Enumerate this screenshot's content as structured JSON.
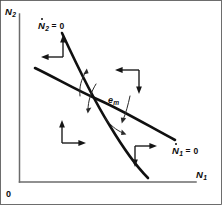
{
  "figure": {
    "kind": "phase-plane-nullcline-diagram",
    "width": 222,
    "height": 205,
    "background_color": "#ffffff",
    "border_color": "#4a4a4a",
    "curve_color": "#101010",
    "axis_color": "#6b6b6b",
    "arrow_color": "#151515"
  },
  "axes": {
    "y_label_var": "N",
    "y_label_sub": "2",
    "x_label_var": "N",
    "x_label_sub": "1",
    "origin_label": "0"
  },
  "nullclines": [
    {
      "id": "n2-nullcline",
      "label_var": "N",
      "label_sub": "2",
      "label_eq": "= 0",
      "overdot": true,
      "shape": "steep-descending",
      "start": [
        62,
        33
      ],
      "end": [
        148,
        178
      ]
    },
    {
      "id": "n1-nullcline",
      "label_var": "N",
      "label_sub": "1",
      "label_eq": "= 0",
      "overdot": true,
      "shape": "shallow-descending-convex",
      "start": [
        35,
        68
      ],
      "end": [
        175,
        140
      ]
    }
  ],
  "equilibrium": {
    "label_var": "e",
    "label_sub": "m",
    "x": 110,
    "y": 103
  },
  "quadrant_flow_arrows": [
    {
      "id": "upper-left",
      "directions": [
        "up",
        "left"
      ]
    },
    {
      "id": "upper-right",
      "directions": [
        "left",
        "down"
      ]
    },
    {
      "id": "lower-left",
      "directions": [
        "up",
        "right"
      ]
    },
    {
      "id": "lower-right",
      "directions": [
        "right",
        "down"
      ]
    }
  ],
  "micro_arcs": [
    {
      "id": "arc-upper-left",
      "direction": "up"
    },
    {
      "id": "arc-left",
      "direction": "down"
    },
    {
      "id": "arc-lower",
      "direction": "down"
    },
    {
      "id": "arc-right",
      "direction": "down"
    }
  ]
}
